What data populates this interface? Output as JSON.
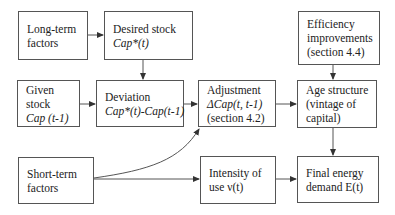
{
  "diagram": {
    "nodes": {
      "long_term": {
        "line1": "Long-term",
        "line2": "factors"
      },
      "desired_stock": {
        "line1": "Desired stock",
        "line2": "Cap*(t)"
      },
      "efficiency": {
        "line1": "Efficiency",
        "line2": "improvements",
        "line3": "(section 4.4)"
      },
      "given_stock": {
        "line1": "Given",
        "line2": "stock",
        "line3": "Cap (t-1)"
      },
      "deviation": {
        "line1": "Deviation",
        "line2": "Cap*(t)-Cap(t-1)"
      },
      "adjustment": {
        "line1": "Adjustment",
        "line2": "ΔCap(t, t-1)",
        "line3": "(section 4.2)"
      },
      "age_structure": {
        "line1": "Age structure",
        "line2": "(vintage of",
        "line3": "capital)"
      },
      "short_term": {
        "line1": "Short-term",
        "line2": "factors"
      },
      "intensity": {
        "line1": "Intensity of",
        "line2": "use ν(t)"
      },
      "final_energy": {
        "line1": "Final energy",
        "line2": "demand E(t)"
      }
    },
    "edges": [
      {
        "from": "long_term",
        "to": "desired_stock"
      },
      {
        "from": "desired_stock",
        "to": "deviation"
      },
      {
        "from": "given_stock",
        "to": "deviation"
      },
      {
        "from": "deviation",
        "to": "adjustment"
      },
      {
        "from": "adjustment",
        "to": "age_structure"
      },
      {
        "from": "efficiency",
        "to": "age_structure"
      },
      {
        "from": "age_structure",
        "to": "final_energy"
      },
      {
        "from": "short_term",
        "to": "adjustment",
        "style": "curved"
      },
      {
        "from": "short_term",
        "to": "intensity"
      },
      {
        "from": "intensity",
        "to": "final_energy"
      }
    ],
    "colors": {
      "stroke": "#555555",
      "text": "#222222",
      "background": "#ffffff"
    }
  }
}
